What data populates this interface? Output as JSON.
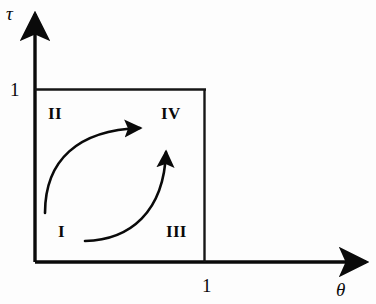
{
  "figure": {
    "type": "phase-diagram",
    "background_color": "#fdfdfd",
    "ink_color": "#0a0a0a",
    "axes": {
      "y_axis_label": "τ",
      "x_axis_label": "θ",
      "y_tick_label": "1",
      "x_tick_label": "1",
      "origin": {
        "x": 35,
        "y": 262
      },
      "y_axis_top": {
        "x": 35,
        "y": 8
      },
      "x_axis_right": {
        "x": 374,
        "y": 262
      }
    },
    "unit_box": {
      "left": 35,
      "top": 89,
      "right": 205,
      "bottom": 262,
      "description": "unit square bounded by tau = 1 and theta = 1"
    },
    "regions": [
      {
        "name": "region-II",
        "label": "II",
        "x": 57,
        "y": 114,
        "quadrant": "upper-left"
      },
      {
        "name": "region-IV",
        "label": "IV",
        "x": 172,
        "y": 114,
        "quadrant": "upper-right"
      },
      {
        "name": "region-I",
        "label": "I",
        "x": 62,
        "y": 232,
        "quadrant": "lower-left"
      },
      {
        "name": "region-III",
        "label": "III",
        "x": 177,
        "y": 232,
        "quadrant": "lower-right"
      }
    ],
    "arrows": [
      {
        "name": "arrow-I-to-IV-upper",
        "from_region": "I",
        "to_region": "IV",
        "start": {
          "x": 45,
          "y": 213
        },
        "end": {
          "x": 146,
          "y": 128
        },
        "direction": "right",
        "curvature": "counter-clockwise arc bulging up-left"
      },
      {
        "name": "arrow-I-to-IV-lower",
        "from_region": "I",
        "to_region": "IV",
        "start": {
          "x": 85,
          "y": 241
        },
        "end": {
          "x": 166,
          "y": 146
        },
        "direction": "up",
        "curvature": "arc bulging down-right"
      }
    ]
  }
}
